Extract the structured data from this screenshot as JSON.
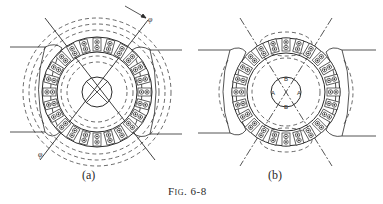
{
  "figure": {
    "caption": "Fig. 6-8",
    "panels": [
      {
        "id": "a",
        "label": "(a)",
        "description": "Armature cross-section with slots, cross-field flux lines (dashed) and brush axis at 45°, flux φ arrows",
        "annotations": [
          "φ",
          "φ"
        ]
      },
      {
        "id": "b",
        "label": "(b)",
        "description": "Armature cross-section with commutating flux paths, inner circle marked with brush positions",
        "annotations": [
          "B",
          "A",
          "A",
          "B"
        ]
      }
    ]
  },
  "colors": {
    "ink": "#2a2a2a",
    "background": "#ffffff"
  }
}
